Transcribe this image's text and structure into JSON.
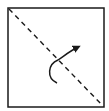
{
  "diagram": {
    "type": "origami-fold-step",
    "square": {
      "x": 8,
      "y": 8,
      "width": 96,
      "height": 99,
      "stroke": "#1a1a1a"
    },
    "fold_line": {
      "style": "dashed",
      "from": [
        9,
        9
      ],
      "to": [
        103,
        106
      ],
      "stroke": "#1a1a1a"
    },
    "arrow": {
      "meaning": "fold-direction",
      "path": "M57 83 C46 78 48 64 58 60 C64 56 70 51 78 47",
      "head_tip": [
        81,
        46
      ],
      "stroke": "#1a1a1a"
    }
  }
}
